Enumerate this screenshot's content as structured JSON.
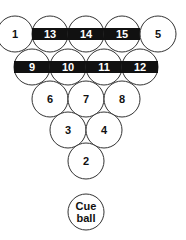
{
  "diagram": {
    "type": "billiard-rack",
    "colors": {
      "ball_outline": "#333333",
      "stripe": "#111111",
      "background": "#ffffff"
    },
    "balls": [
      {
        "label": "1",
        "cx": 15,
        "cy": 34,
        "striped": false
      },
      {
        "label": "13",
        "cx": 50,
        "cy": 34,
        "striped": true
      },
      {
        "label": "14",
        "cx": 86,
        "cy": 34,
        "striped": true
      },
      {
        "label": "15",
        "cx": 122,
        "cy": 34,
        "striped": true
      },
      {
        "label": "5",
        "cx": 158,
        "cy": 34,
        "striped": false
      },
      {
        "label": "9",
        "cx": 32,
        "cy": 67,
        "striped": true
      },
      {
        "label": "10",
        "cx": 68,
        "cy": 67,
        "striped": true
      },
      {
        "label": "11",
        "cx": 104,
        "cy": 67,
        "striped": true
      },
      {
        "label": "12",
        "cx": 140,
        "cy": 67,
        "striped": true
      },
      {
        "label": "6",
        "cx": 50,
        "cy": 99,
        "striped": false
      },
      {
        "label": "7",
        "cx": 86,
        "cy": 99,
        "striped": false
      },
      {
        "label": "8",
        "cx": 122,
        "cy": 99,
        "striped": false
      },
      {
        "label": "3",
        "cx": 68,
        "cy": 130,
        "striped": false
      },
      {
        "label": "4",
        "cx": 104,
        "cy": 130,
        "striped": false
      },
      {
        "label": "2",
        "cx": 86,
        "cy": 161,
        "striped": false
      }
    ],
    "cue_ball": {
      "line1": "Cue",
      "line2": "ball",
      "cx": 86,
      "cy": 212
    }
  }
}
